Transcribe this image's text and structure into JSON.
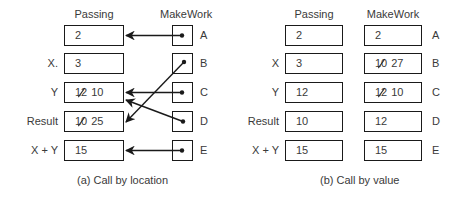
{
  "diagram_a": {
    "caption": "(a)  Call by location",
    "headers": {
      "passing": "Passing",
      "makework": "MakeWork"
    },
    "rows": [
      {
        "label": "",
        "old_value": "",
        "value": "2",
        "param": "A",
        "points_to_row": 0
      },
      {
        "label": "X.",
        "old_value": "",
        "value": "3",
        "param": "B",
        "points_to_row": 3
      },
      {
        "label": "Y",
        "old_value": "12",
        "value": "10",
        "param": "C",
        "points_to_row": 2
      },
      {
        "label": "Result",
        "old_value": "10",
        "value": "25",
        "param": "D",
        "points_to_row": 2
      },
      {
        "label": "X + Y",
        "old_value": "",
        "value": "15",
        "param": "E",
        "points_to_row": 4
      }
    ]
  },
  "diagram_b": {
    "caption": "(b)  Call by value",
    "headers": {
      "passing": "Passing",
      "makework": "MakeWork"
    },
    "rows": [
      {
        "label": "",
        "passing_value": "12",
        "makework_old": "",
        "makework_value": "2",
        "param": "A"
      },
      {
        "label": "X",
        "passing_value": "3",
        "makework_old": "10",
        "makework_value": "27",
        "param": "B"
      },
      {
        "label": "Y",
        "passing_value": "12",
        "makework_old": "12",
        "makework_value": "10",
        "param": "C"
      },
      {
        "label": "Result",
        "passing_value": "10",
        "makework_old": "",
        "makework_value": "12",
        "param": "D"
      },
      {
        "label": "X + Y",
        "passing_value": "15",
        "makework_old": "",
        "makework_value": "15",
        "param": "E"
      }
    ]
  },
  "colors": {
    "stroke": "#1a1a1a",
    "text": "#3a3a3a",
    "background": "#ffffff"
  }
}
